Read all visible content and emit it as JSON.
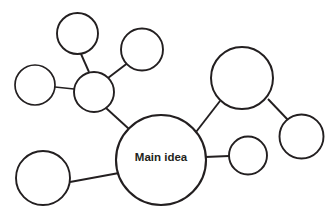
{
  "diagram": {
    "type": "bubble-map",
    "title": "Main idea",
    "background_color": "#ffffff",
    "stroke_color": "#231f20",
    "fill_color": "#ffffff",
    "canvas": {
      "width": 336,
      "height": 221
    },
    "center_node": {
      "id": "main-idea",
      "label": "Main idea",
      "cx": 161,
      "cy": 160,
      "r": 45,
      "stroke_width": 2.1,
      "font_size": 11.5
    },
    "nodes": [
      {
        "id": "hub-left",
        "label": "",
        "cx": 94,
        "cy": 92,
        "r": 20,
        "stroke_width": 1.9
      },
      {
        "id": "top-left",
        "label": "",
        "cx": 77.5,
        "cy": 33.5,
        "r": 20.5,
        "stroke_width": 1.9
      },
      {
        "id": "top-middle",
        "label": "",
        "cx": 142,
        "cy": 49.5,
        "r": 21,
        "stroke_width": 1.9
      },
      {
        "id": "far-left",
        "label": "",
        "cx": 35,
        "cy": 85,
        "r": 20,
        "stroke_width": 1.7
      },
      {
        "id": "bottom-left",
        "label": "",
        "cx": 43,
        "cy": 178,
        "r": 27,
        "stroke_width": 1.9
      },
      {
        "id": "right-large",
        "label": "",
        "cx": 242,
        "cy": 78,
        "r": 31,
        "stroke_width": 2.0
      },
      {
        "id": "far-right",
        "label": "",
        "cx": 301.5,
        "cy": 136.5,
        "r": 22,
        "stroke_width": 1.9
      },
      {
        "id": "right-small",
        "label": "",
        "cx": 248,
        "cy": 155.5,
        "r": 19,
        "stroke_width": 1.9
      }
    ],
    "edges": [
      {
        "id": "edge-main-hub",
        "from": "main-idea",
        "to": "hub-left",
        "x1": 129,
        "y1": 129,
        "x2": 106,
        "y2": 108,
        "stroke_width": 1.9
      },
      {
        "id": "edge-hub-topleft",
        "from": "hub-left",
        "to": "top-left",
        "x1": 89,
        "y1": 72,
        "x2": 81,
        "y2": 54,
        "stroke_width": 1.9
      },
      {
        "id": "edge-hub-topmiddle",
        "from": "hub-left",
        "to": "top-middle",
        "x1": 108,
        "y1": 78,
        "x2": 129,
        "y2": 62,
        "stroke_width": 1.9
      },
      {
        "id": "edge-hub-farleft",
        "from": "hub-left",
        "to": "far-left",
        "x1": 74,
        "y1": 89,
        "x2": 55,
        "y2": 87,
        "stroke_width": 1.7
      },
      {
        "id": "edge-main-bottomleft",
        "from": "main-idea",
        "to": "bottom-left",
        "x1": 119,
        "y1": 173,
        "x2": 70,
        "y2": 182,
        "stroke_width": 1.9
      },
      {
        "id": "edge-main-rightlarge",
        "from": "main-idea",
        "to": "right-large",
        "x1": 196,
        "y1": 132,
        "x2": 220,
        "y2": 101,
        "stroke_width": 1.9
      },
      {
        "id": "edge-rightlarge-farright",
        "from": "right-large",
        "to": "far-right",
        "x1": 268,
        "y1": 99,
        "x2": 288,
        "y2": 120,
        "stroke_width": 1.9
      },
      {
        "id": "edge-main-rightsmall",
        "from": "main-idea",
        "to": "right-small",
        "x1": 205,
        "y1": 157,
        "x2": 229,
        "y2": 156,
        "stroke_width": 1.9
      }
    ]
  }
}
